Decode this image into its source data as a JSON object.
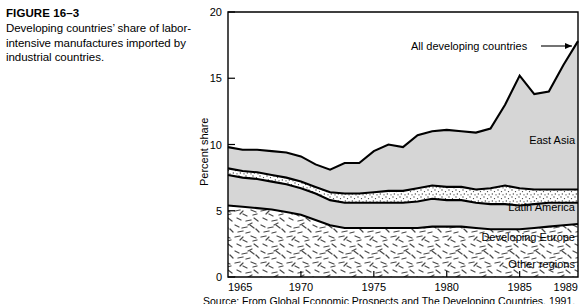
{
  "figure": {
    "number_label": "FIGURE 16–3",
    "caption": "Developing countries’ share of labor-intensive manufactures imported by industrial countries."
  },
  "source": {
    "text": "Source: From Global Economic Prospects and The Developing Countries, 1991."
  },
  "chart_data": {
    "type": "area",
    "stacked": true,
    "title": "",
    "subtitle": "",
    "xlabel": "",
    "ylabel": "Percent share",
    "xlim": [
      1965,
      1989
    ],
    "ylim": [
      0,
      20
    ],
    "ytick_values": [
      0,
      5,
      10,
      15,
      20
    ],
    "ytick_labels": [
      "0",
      "5",
      "10",
      "15",
      "20"
    ],
    "xtick_values": [
      1965,
      1970,
      1975,
      1980,
      1985,
      1989
    ],
    "xtick_labels": [
      "1965",
      "1970",
      "1975",
      "1980",
      "1985",
      "1989"
    ],
    "grid": false,
    "legend_position": "inline-annotations",
    "x": [
      1965,
      1966,
      1967,
      1968,
      1969,
      1970,
      1971,
      1972,
      1973,
      1974,
      1975,
      1976,
      1977,
      1978,
      1979,
      1980,
      1981,
      1982,
      1983,
      1984,
      1985,
      1986,
      1987,
      1988,
      1989
    ],
    "series": [
      {
        "name": "Other regions",
        "fill": "worm-hatch",
        "values": [
          5.4,
          5.3,
          5.2,
          5.1,
          4.9,
          4.7,
          4.3,
          3.9,
          3.7,
          3.7,
          3.7,
          3.7,
          3.7,
          3.7,
          3.8,
          3.8,
          3.8,
          3.7,
          3.6,
          3.6,
          3.6,
          3.7,
          3.8,
          3.9,
          4.0
        ]
      },
      {
        "name": "Developing Europe",
        "fill": "solid-gray",
        "values": [
          2.3,
          2.2,
          2.2,
          2.1,
          2.1,
          2.0,
          2.0,
          1.9,
          1.9,
          1.9,
          1.9,
          1.9,
          1.9,
          2.0,
          2.1,
          2.0,
          2.0,
          1.9,
          1.9,
          1.9,
          1.8,
          1.8,
          1.8,
          1.7,
          1.6
        ]
      },
      {
        "name": "Latin America",
        "fill": "stipple",
        "values": [
          0.5,
          0.5,
          0.5,
          0.5,
          0.5,
          0.5,
          0.5,
          0.6,
          0.7,
          0.7,
          0.8,
          0.9,
          0.9,
          1.0,
          1.0,
          1.0,
          1.0,
          1.0,
          1.2,
          1.4,
          1.3,
          1.1,
          1.0,
          1.0,
          1.0
        ]
      },
      {
        "name": "East Asia",
        "fill": "solid-gray",
        "values": [
          1.6,
          1.6,
          1.7,
          1.8,
          1.9,
          1.9,
          1.7,
          1.7,
          2.3,
          2.3,
          3.1,
          3.5,
          3.3,
          4.0,
          4.1,
          4.3,
          4.2,
          4.3,
          4.5,
          6.1,
          8.5,
          7.2,
          7.4,
          9.4,
          11.2
        ]
      }
    ],
    "total_series": {
      "name": "All developing countries",
      "values": [
        9.8,
        9.6,
        9.6,
        9.5,
        9.4,
        9.1,
        8.5,
        8.1,
        8.6,
        8.6,
        9.5,
        10.0,
        9.8,
        10.7,
        11.0,
        11.1,
        11.0,
        10.9,
        11.2,
        13.0,
        15.2,
        13.8,
        14.0,
        16.0,
        17.8
      ]
    },
    "annotations": [
      {
        "name": "all-developing-countries",
        "text": "All developing countries"
      },
      {
        "name": "east-asia",
        "text": "East Asia"
      },
      {
        "name": "latin-america",
        "text": "Latin America"
      },
      {
        "name": "developing-europe",
        "text": "Developing Europe"
      },
      {
        "name": "other-regions",
        "text": "Other regions"
      }
    ]
  }
}
